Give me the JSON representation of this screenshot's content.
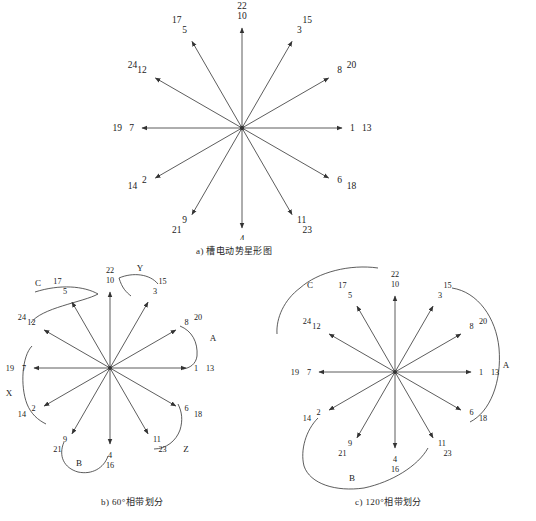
{
  "figure": {
    "panels": [
      {
        "id": "a",
        "caption": "a) 槽电动势星形图",
        "type": "slot-emf-star",
        "center": [
          242,
          128
        ],
        "radius": 100,
        "spokes": [
          {
            "angle_deg": 0,
            "outer_label": "1",
            "inner_label": "13"
          },
          {
            "angle_deg": 30,
            "outer_label": "8",
            "inner_label": "20"
          },
          {
            "angle_deg": 60,
            "outer_label": "3",
            "inner_label": "15"
          },
          {
            "angle_deg": 90,
            "outer_label": "10",
            "inner_label": "22"
          },
          {
            "angle_deg": 120,
            "outer_label": "5",
            "inner_label": "17"
          },
          {
            "angle_deg": 150,
            "outer_label": "12",
            "inner_label": "24"
          },
          {
            "angle_deg": 180,
            "outer_label": "7",
            "inner_label": "19"
          },
          {
            "angle_deg": 210,
            "outer_label": "2",
            "inner_label": "14"
          },
          {
            "angle_deg": 240,
            "outer_label": "9",
            "inner_label": "21"
          },
          {
            "angle_deg": 270,
            "outer_label": "4",
            "inner_label": "16"
          },
          {
            "angle_deg": 300,
            "outer_label": "11",
            "inner_label": "23"
          },
          {
            "angle_deg": 330,
            "outer_label": "6",
            "inner_label": "18"
          }
        ],
        "brackets": []
      },
      {
        "id": "b",
        "caption": "b) 60°相带划分",
        "type": "slot-emf-star",
        "center": [
          110,
          368
        ],
        "radius": 76,
        "spokes": [
          {
            "angle_deg": 0,
            "outer_label": "1",
            "inner_label": "13"
          },
          {
            "angle_deg": 30,
            "outer_label": "8",
            "inner_label": "20"
          },
          {
            "angle_deg": 60,
            "outer_label": "3",
            "inner_label": "15"
          },
          {
            "angle_deg": 90,
            "outer_label": "10",
            "inner_label": "22"
          },
          {
            "angle_deg": 120,
            "outer_label": "5",
            "inner_label": "17"
          },
          {
            "angle_deg": 150,
            "outer_label": "12",
            "inner_label": "24"
          },
          {
            "angle_deg": 180,
            "outer_label": "7",
            "inner_label": "19"
          },
          {
            "angle_deg": 210,
            "outer_label": "2",
            "inner_label": "14"
          },
          {
            "angle_deg": 240,
            "outer_label": "9",
            "inner_label": "21"
          },
          {
            "angle_deg": 270,
            "outer_label": "4",
            "inner_label": "16"
          },
          {
            "angle_deg": 300,
            "outer_label": "11",
            "inner_label": "23"
          },
          {
            "angle_deg": 330,
            "outer_label": "6",
            "inner_label": "18"
          }
        ],
        "brackets": [
          {
            "label": "A",
            "label_pos": [
              213,
              341
            ]
          },
          {
            "label": "B",
            "label_pos": [
              79,
              466
            ]
          },
          {
            "label": "C",
            "label_pos": [
              38,
              286
            ]
          },
          {
            "label": "X",
            "label_pos": [
              9,
              396
            ]
          },
          {
            "label": "Y",
            "label_pos": [
              140,
              271
            ]
          },
          {
            "label": "Z",
            "label_pos": [
              186,
              452
            ]
          }
        ]
      },
      {
        "id": "c",
        "caption": "c) 120°相带划分",
        "type": "slot-emf-star",
        "center": [
          395,
          372
        ],
        "radius": 76,
        "spokes": [
          {
            "angle_deg": 0,
            "outer_label": "1",
            "inner_label": "13"
          },
          {
            "angle_deg": 30,
            "outer_label": "8",
            "inner_label": "20"
          },
          {
            "angle_deg": 60,
            "outer_label": "3",
            "inner_label": "15"
          },
          {
            "angle_deg": 90,
            "outer_label": "10",
            "inner_label": "22"
          },
          {
            "angle_deg": 120,
            "outer_label": "5",
            "inner_label": "17"
          },
          {
            "angle_deg": 150,
            "outer_label": "12",
            "inner_label": "24"
          },
          {
            "angle_deg": 180,
            "outer_label": "7",
            "inner_label": "19"
          },
          {
            "angle_deg": 210,
            "outer_label": "2",
            "inner_label": "14"
          },
          {
            "angle_deg": 240,
            "outer_label": "9",
            "inner_label": "21"
          },
          {
            "angle_deg": 270,
            "outer_label": "4",
            "inner_label": "16"
          },
          {
            "angle_deg": 300,
            "outer_label": "11",
            "inner_label": "23"
          },
          {
            "angle_deg": 330,
            "outer_label": "6",
            "inner_label": "18"
          }
        ],
        "brackets": [
          {
            "label": "A",
            "label_pos": [
              506,
              368
            ]
          },
          {
            "label": "B",
            "label_pos": [
              352,
              481
            ]
          },
          {
            "label": "C",
            "label_pos": [
              310,
              288
            ]
          }
        ]
      }
    ]
  },
  "style": {
    "line_color": "#333333",
    "text_color": "#1a1a1a",
    "background": "#ffffff"
  }
}
